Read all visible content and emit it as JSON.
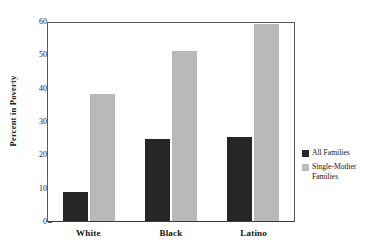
{
  "chart_data": {
    "type": "bar",
    "title": "",
    "subtitle": "",
    "xlabel": "",
    "ylabel": "Percent in Poverty",
    "categories": [
      "White",
      "Black",
      "Latino"
    ],
    "series": [
      {
        "name": "All Families",
        "values": [
          8.7,
          24.7,
          25.3
        ],
        "color": "#262626"
      },
      {
        "name": "Single-Mother Families",
        "values": [
          38.2,
          51.0,
          59.0
        ],
        "color": "#b9b9b9"
      }
    ],
    "ylim": [
      0,
      60
    ],
    "yticks": [
      0,
      10,
      20,
      30,
      40,
      50,
      60
    ],
    "ytick_labels": [
      "0",
      "10",
      "20",
      "30",
      "40",
      "50",
      "60"
    ],
    "grid": false,
    "legend_position": "right-outside",
    "annotations": []
  },
  "axis": {
    "y_title": "Percent in Poverty",
    "tick_0": "0",
    "tick_10": "10",
    "tick_20": "20",
    "tick_30": "30",
    "tick_40": "40",
    "tick_50": "50",
    "tick_60": "60"
  },
  "xlabels": {
    "cat0": "White",
    "cat1": "Black",
    "cat2": "Latino"
  },
  "legend": {
    "series0": "All Families",
    "series1": "Single-Mother\nFamilies"
  }
}
